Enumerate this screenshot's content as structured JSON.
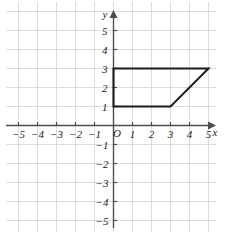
{
  "chart_data": {
    "type": "line",
    "title": "",
    "xlabel": "x",
    "ylabel": "y",
    "origin_label": "O",
    "grid": true,
    "xlim": [
      -5.5,
      5.2
    ],
    "ylim": [
      -5.6,
      5.6
    ],
    "x_ticks": [
      -5,
      -4,
      -3,
      -2,
      -1,
      1,
      2,
      3,
      4,
      5
    ],
    "y_ticks": [
      5,
      4,
      3,
      2,
      1,
      -1,
      -2,
      -3,
      -4,
      -5
    ],
    "x_tick_labels": [
      "−5",
      "−4",
      "−3",
      "−2",
      "−1",
      "1",
      "2",
      "3",
      "4",
      "5"
    ],
    "y_tick_labels": [
      "5",
      "4",
      "3",
      "2",
      "1",
      "−1",
      "−2",
      "−3",
      "−4",
      "−5"
    ],
    "series": [
      {
        "name": "trapezoid",
        "closed": true,
        "points": [
          {
            "x": 0,
            "y": 1
          },
          {
            "x": 0,
            "y": 3
          },
          {
            "x": 5,
            "y": 3
          },
          {
            "x": 3,
            "y": 1
          }
        ]
      }
    ],
    "colors": {
      "grid": "#dcdcdc",
      "axis": "#4d4d4d",
      "shape": "#1a1a1a",
      "background": "#ffffff"
    }
  }
}
